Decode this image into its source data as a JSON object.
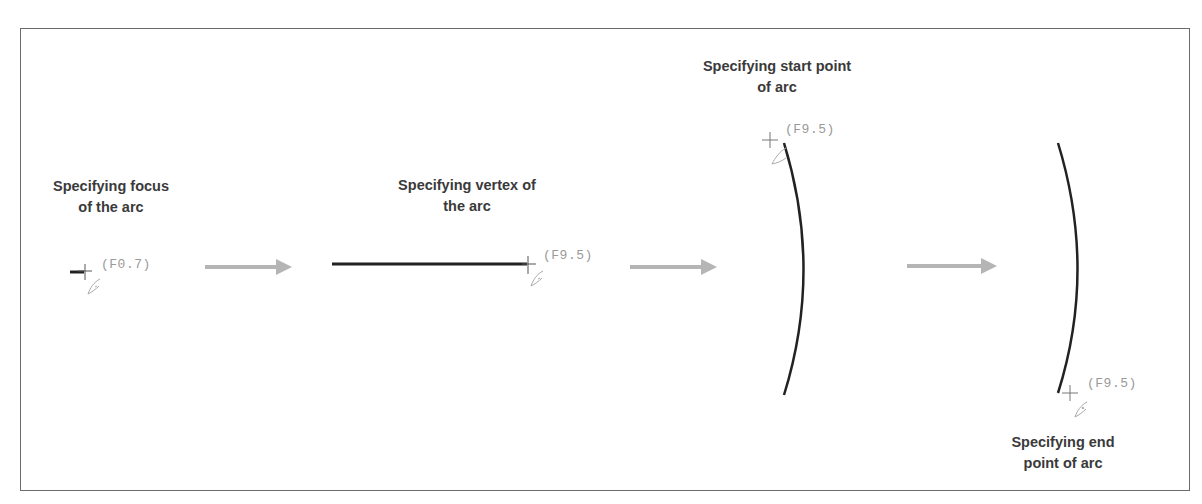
{
  "colors": {
    "frame": "#6b6b6b",
    "geometry": "#222222",
    "arrow": "#b5b5b5",
    "cursor": "#8a8a8a",
    "coord_text": "#9a9a9a",
    "label_text": "#3a3a3a"
  },
  "steps": [
    {
      "label_line1": "Specifying focus",
      "label_line2": "of the arc",
      "coord": "(F0.7)",
      "icons": [
        "crosshair-cursor-icon",
        "pen-icon"
      ]
    },
    {
      "label_line1": "Specifying vertex of",
      "label_line2": "the arc",
      "coord": "(F9.5)",
      "icons": [
        "crosshair-cursor-icon",
        "pen-icon"
      ]
    },
    {
      "label_line1": "Specifying start point",
      "label_line2": "of arc",
      "coord": "(F9.5)",
      "icons": [
        "crosshair-cursor-icon",
        "pen-icon"
      ]
    },
    {
      "label_line1": "Specifying end",
      "label_line2": "point of arc",
      "coord": "(F9.5)",
      "icons": [
        "crosshair-cursor-icon",
        "pen-icon"
      ]
    }
  ],
  "arrows": [
    {
      "name": "step-1-to-2"
    },
    {
      "name": "step-2-to-3"
    },
    {
      "name": "step-3-to-4"
    }
  ]
}
